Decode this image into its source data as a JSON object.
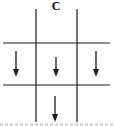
{
  "diagram": {
    "label": "C",
    "colors": {
      "line": "#1a1a1a",
      "background": "#ffffff"
    },
    "grid": {
      "vertical_lines_x": [
        36,
        77
      ],
      "vertical_span": [
        9,
        122
      ],
      "horizontal_lines_y": [
        43,
        85
      ],
      "horizontal_span": [
        3,
        110
      ]
    },
    "arrows": [
      {
        "name": "left-cell-arrow",
        "direction": "down",
        "x": 16,
        "y1": 51,
        "y2": 77
      },
      {
        "name": "center-cell-arrow",
        "direction": "down",
        "x": 56,
        "y1": 57,
        "y2": 77
      },
      {
        "name": "right-cell-arrow",
        "direction": "down",
        "x": 96,
        "y1": 51,
        "y2": 77
      },
      {
        "name": "bottom-center-arrow",
        "direction": "down",
        "x": 55,
        "y1": 96,
        "y2": 122
      }
    ]
  }
}
